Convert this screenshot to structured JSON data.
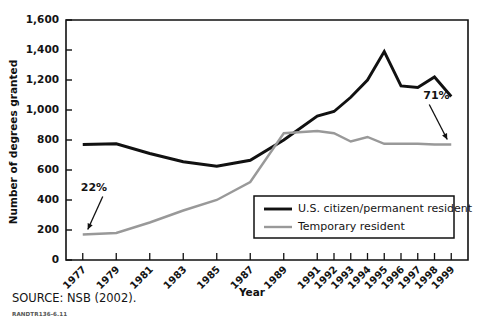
{
  "figure": {
    "source_note": "SOURCE: NSB (2002).",
    "rand_id": "RANDTR136-6.11"
  },
  "chart_data": {
    "type": "line",
    "title": "",
    "xlabel": "Year",
    "ylabel": "Number of degrees granted",
    "categories": [
      "1977",
      "1979",
      "1981",
      "1983",
      "1985",
      "1987",
      "1989",
      "1991",
      "1992",
      "1993",
      "1994",
      "1995",
      "1996",
      "1997",
      "1998",
      "1999"
    ],
    "x_positions": [
      1977,
      1979,
      1981,
      1983,
      1985,
      1987,
      1989,
      1991,
      1992,
      1993,
      1994,
      1995,
      1996,
      1997,
      1998,
      1999
    ],
    "xlim": [
      1976,
      2000
    ],
    "ylim": [
      0,
      1600
    ],
    "ytick_labels": [
      "0",
      "200",
      "400",
      "600",
      "800",
      "1,000",
      "1,200",
      "1,400",
      "1,600"
    ],
    "yticks": [
      0,
      200,
      400,
      600,
      800,
      1000,
      1200,
      1400,
      1600
    ],
    "grid": false,
    "legend_position": "lower right",
    "series": [
      {
        "name": "U.S. citizen/permanent resident",
        "color": "#111111",
        "width": 2.9,
        "values": [
          770,
          775,
          710,
          655,
          625,
          665,
          800,
          960,
          990,
          1085,
          1200,
          1390,
          1160,
          1150,
          1220,
          1090
        ]
      },
      {
        "name": "Temporary resident",
        "color": "#999999",
        "width": 2.4,
        "values": [
          170,
          180,
          250,
          330,
          400,
          520,
          845,
          860,
          845,
          790,
          820,
          775,
          775,
          775,
          770,
          770
        ]
      }
    ],
    "annotations": [
      {
        "label": "22%",
        "target_x": 1977,
        "target_y": 170
      },
      {
        "label": "71%",
        "target_x": 1999,
        "target_y": 770
      }
    ]
  }
}
